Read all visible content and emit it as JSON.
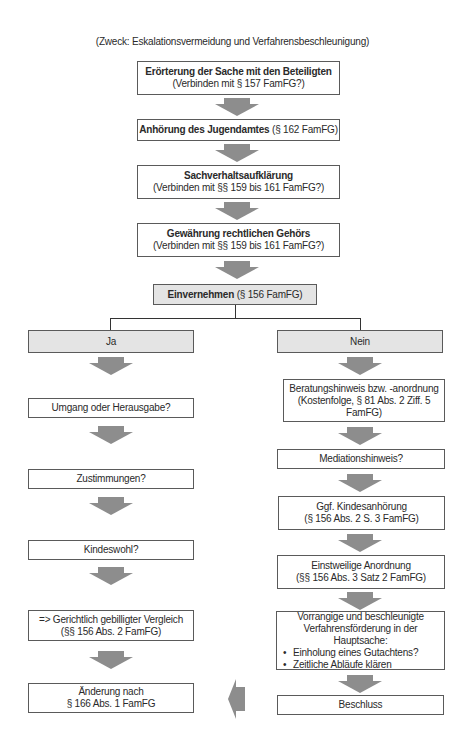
{
  "subtitle": "(Zweck: Eskalationsvermeidung und Verfahrensbeschleunigung)",
  "main_steps": [
    {
      "title": "Erörterung der Sache mit den Beteiligten",
      "note": "(Verbinden mit § 157 FamFG?)"
    },
    {
      "title": "Anhörung des Jugendamtes",
      "note": "(§ 162 FamFG)"
    },
    {
      "title": "Sachverhaltsaufklärung",
      "note": "(Verbinden mit §§ 159 bis 161 FamFG?)"
    },
    {
      "title": "Gewährung rechtlichen Gehörs",
      "note": "(Verbinden mit §§ 159 bis 161 FamFG?)"
    }
  ],
  "decision": {
    "title": "Einvernehmen",
    "note": "(§ 156 FamFG)"
  },
  "branches": {
    "yes": {
      "label": "Ja",
      "steps": [
        {
          "line1": "Umgang oder Herausgabe?"
        },
        {
          "line1": "Zustimmungen?"
        },
        {
          "line1": "Kindeswohl?"
        },
        {
          "line1": "=> Gerichtlich gebilligter Vergleich",
          "line2": "(§§ 156 Abs. 2 FamFG)"
        },
        {
          "line1": "Änderung nach",
          "line2": "§ 166 Abs. 1 FamFG"
        }
      ]
    },
    "no": {
      "label": "Nein",
      "steps": [
        {
          "line1": "Beratungshinweis bzw. -anordnung",
          "line2": "(Kostenfolge, § 81 Abs. 2 Ziff. 5",
          "line3": "FamFG)"
        },
        {
          "line1": "Mediationshinweis?"
        },
        {
          "line1": "Ggf. Kindesanhörung",
          "line2": "(§ 156 Abs. 2 S. 3 FamFG)"
        },
        {
          "line1": "Einstweilige Anordnung",
          "line2": "(§§ 156 Abs. 3 Satz 2 FamFG)"
        },
        {
          "line1": "Vorrangige und beschleunigte",
          "line2": "Verfahrensförderung in der Hauptsache:",
          "bullets": [
            "Einholung eines Gutachtens?",
            "Zeitliche Abläufe klären"
          ]
        },
        {
          "line1": "Beschluss"
        }
      ]
    }
  },
  "colors": {
    "arrow": "#8d8d8d",
    "shaded_box": "#e4e4e4",
    "border": "#5a5a5a",
    "connector": "#333333"
  }
}
